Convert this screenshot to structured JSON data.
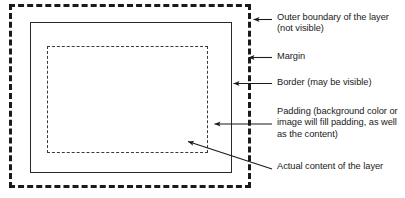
{
  "diagram": {
    "colors": {
      "stroke": "#1a1a1a",
      "background": "#ffffff",
      "solid_border": "#2a2a2a",
      "inner_dashed": "#3a3a3a"
    },
    "boxes": [
      {
        "name": "outer-boundary",
        "style": "thick-dashed",
        "label": "Outer boundary of the layer (not visible)"
      },
      {
        "name": "border",
        "style": "solid",
        "label": "Border (may be visible)"
      },
      {
        "name": "padding",
        "style": "thin-dashed",
        "label": "Padding"
      }
    ],
    "callouts": [
      {
        "id": "outer-boundary",
        "label": "Outer boundary of the layer\n(not visible)",
        "arrow": "left"
      },
      {
        "id": "margin",
        "label": "Margin",
        "arrow": "left"
      },
      {
        "id": "border",
        "label": "Border (may be visible)",
        "arrow": "left"
      },
      {
        "id": "padding",
        "label": "Padding (background color or\nimage will fill padding, as well\nas the content)",
        "arrow": "left"
      },
      {
        "id": "content",
        "label": "Actual content of the layer",
        "arrow": "diagonal-up-left"
      }
    ]
  }
}
